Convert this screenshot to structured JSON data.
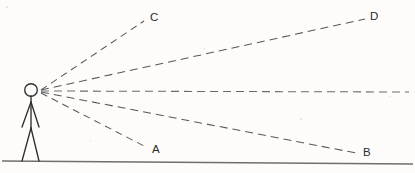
{
  "figure": {
    "background_color": "#fdfcfa",
    "line_color": "#58585a",
    "ground_color": "#6f6f70",
    "figure_color": "#2e2e2e"
  },
  "observer": {
    "name": "stick-figure-observer",
    "eye_x": 40,
    "eye_y": 91,
    "head_cx": 31,
    "head_cy": 90,
    "head_r": 6.3
  },
  "ground": {
    "name": "ground-line",
    "x1": 2,
    "y1": 161,
    "x2": 413,
    "y2": 164
  },
  "rays": [
    {
      "id": "ray-c",
      "label": "C",
      "label_x": 150,
      "label_y": 21,
      "x1": 41,
      "y1": 90,
      "x2": 144,
      "y2": 21,
      "dash": "7 5"
    },
    {
      "id": "ray-d",
      "label": "D",
      "label_x": 370,
      "label_y": 20,
      "x1": 41,
      "y1": 90,
      "x2": 365,
      "y2": 19,
      "dash": "8 5"
    },
    {
      "id": "ray-horizon",
      "label": "",
      "label_x": 0,
      "label_y": 0,
      "x1": 41,
      "y1": 91,
      "x2": 409,
      "y2": 92,
      "dash": "8 5"
    },
    {
      "id": "ray-b",
      "label": "B",
      "label_x": 363,
      "label_y": 156,
      "x1": 41,
      "y1": 92,
      "x2": 356,
      "y2": 153,
      "dash": "8 5"
    },
    {
      "id": "ray-a",
      "label": "A",
      "label_x": 152,
      "label_y": 153,
      "x1": 41,
      "y1": 93,
      "x2": 146,
      "y2": 147,
      "dash": "7 5"
    }
  ],
  "body": {
    "torso": {
      "x1": 31,
      "y1": 96,
      "x2": 31,
      "y2": 128
    },
    "arm_left": {
      "x1": 31,
      "y1": 102,
      "x2": 22,
      "y2": 127
    },
    "arm_right": {
      "x1": 31,
      "y1": 102,
      "x2": 39,
      "y2": 127
    },
    "leg_left": {
      "x1": 31,
      "y1": 128,
      "x2": 22,
      "y2": 161
    },
    "leg_right": {
      "x1": 31,
      "y1": 128,
      "x2": 39,
      "y2": 161
    }
  }
}
